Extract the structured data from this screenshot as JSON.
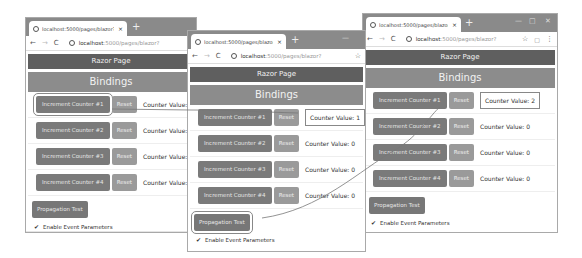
{
  "windows": [
    {
      "tab_title": "localhost:5000/pages/blazor?",
      "url_host": "localhost",
      "url_path": ":5000/pages/blazor?",
      "header": "Razor Page",
      "subheader": "Bindings",
      "counters": [
        {
          "increment": "Increment Counter #1",
          "reset": "Reset",
          "value": "Counter Value: 0"
        },
        {
          "increment": "Increment Counter #2",
          "reset": "Reset",
          "value": "Counter Value: 0"
        },
        {
          "increment": "Increment Counter #3",
          "reset": "Reset",
          "value": "Counter Value: 0"
        },
        {
          "increment": "Increment Counter #4",
          "reset": "Reset",
          "value": "Counter Value: 0"
        }
      ],
      "propagation": "Propagation Test",
      "checkbox_label": "Enable Event Parameters"
    },
    {
      "tab_title": "localhost:5000/pages/blazor?",
      "url_host": "localhost",
      "url_path": ":5000/pages/blazor?",
      "header": "Razor Page",
      "subheader": "Bindings",
      "counters": [
        {
          "increment": "Increment Counter #1",
          "reset": "Reset",
          "value": "Counter Value: 1"
        },
        {
          "increment": "Increment Counter #2",
          "reset": "Reset",
          "value": "Counter Value: 0"
        },
        {
          "increment": "Increment Counter #3",
          "reset": "Reset",
          "value": "Counter Value: 0"
        },
        {
          "increment": "Increment Counter #4",
          "reset": "Reset",
          "value": "Counter Value: 0"
        }
      ],
      "propagation": "Propagation Test",
      "checkbox_label": "Enable Event Parameters"
    },
    {
      "tab_title": "localhost:5000/pages/blazor?",
      "url_host": "localhost",
      "url_path": ":5000/pages/blazor?",
      "header": "Razor Page",
      "subheader": "Bindings",
      "counters": [
        {
          "increment": "Increment Counter #1",
          "reset": "Reset",
          "value": "Counter Value: 2"
        },
        {
          "increment": "Increment Counter #2",
          "reset": "Reset",
          "value": "Counter Value: 0"
        },
        {
          "increment": "Increment Counter #3",
          "reset": "Reset",
          "value": "Counter Value: 0"
        },
        {
          "increment": "Increment Counter #4",
          "reset": "Reset",
          "value": "Counter Value: 0"
        }
      ],
      "propagation": "Propagation Test",
      "checkbox_label": "Enable Event Parameters"
    }
  ],
  "icons": {
    "globe": "globe-icon",
    "close": "×",
    "newtab": "+",
    "back": "←",
    "forward": "→",
    "reload": "C",
    "star": "☆",
    "menu": "⋮",
    "check": "✔"
  }
}
